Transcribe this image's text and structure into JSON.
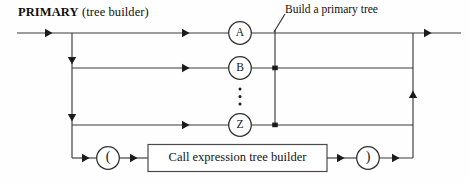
{
  "diagram": {
    "title_main": "PRIMARY",
    "title_sub": " (tree builder)",
    "annotation": "Build a primary tree",
    "type": "railroad-syntax-diagram",
    "colors": {
      "line": "#3a3a3a",
      "arrow": "#1b1b1b",
      "text": "#151515",
      "background": "#fefefe",
      "node_stroke": "#2e2e2e"
    },
    "alternatives": [
      {
        "id": "a",
        "label": "A",
        "shape": "circle"
      },
      {
        "id": "b",
        "label": "B",
        "shape": "circle"
      },
      {
        "id": "ellipsis",
        "label": "",
        "shape": "vertical-ellipsis"
      },
      {
        "id": "z",
        "label": "Z",
        "shape": "circle"
      }
    ],
    "call_branch": {
      "open_paren": "(",
      "box_label": "Call expression tree builder",
      "close_paren": ")"
    }
  }
}
